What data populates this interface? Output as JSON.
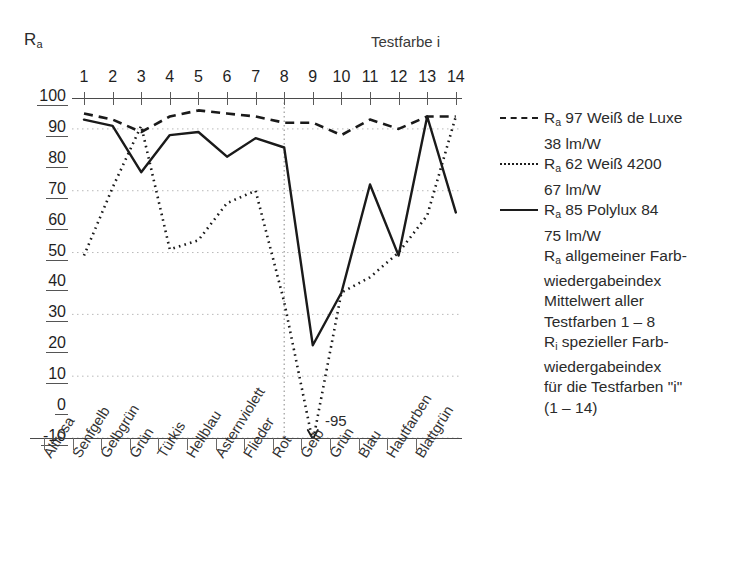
{
  "axes": {
    "y_title": "R",
    "y_title_sub": "a",
    "x_title": "Testfarbe i",
    "y_ticks": [
      "100",
      "90",
      "80",
      "70",
      "60",
      "50",
      "40",
      "30",
      "20",
      "10",
      "0",
      "-10"
    ],
    "x_numbers": [
      "1",
      "2",
      "3",
      "4",
      "5",
      "6",
      "7",
      "8",
      "9",
      "10",
      "11",
      "12",
      "13",
      "14"
    ]
  },
  "annotation": {
    "off_scale_value": "-95"
  },
  "legend": {
    "items": [
      {
        "key": "dashed",
        "r": "R",
        "sub": "a",
        "title": "97 Weiß de Luxe",
        "efficacy": "38 lm/W"
      },
      {
        "key": "dotted",
        "r": "R",
        "sub": "a",
        "title": "62 Weiß 4200",
        "efficacy": "67 lm/W"
      },
      {
        "key": "solid",
        "r": "R",
        "sub": "a",
        "title": "85 Polylux 84",
        "efficacy": "75 lm/W"
      }
    ]
  },
  "notes": {
    "lines": [
      "allgemeiner Farb-",
      "wiedergabeindex",
      "Mittelwert aller",
      "Testfarben 1 – 8"
    ],
    "ra_symbol": "R",
    "ra_sub": "a",
    "ri_symbol": "R",
    "ri_sub": "i",
    "lines2": [
      "spezieller Farb-",
      "wiedergabeindex",
      "für die Testfarben \"i\"",
      "(1 – 14)"
    ]
  },
  "chart_data": {
    "type": "line",
    "title": "",
    "xlabel": "Testfarbe i",
    "ylabel": "Ra",
    "ylim": [
      -10,
      100
    ],
    "grid": true,
    "legend_position": "right",
    "categories": [
      "Altrosa",
      "Senfgelb",
      "Gelbgrün",
      "Grün",
      "Türkis",
      "Hellblau",
      "Asternviolett",
      "Flieder",
      "Rot",
      "Gelb",
      "Grün",
      "Blau",
      "Hautfarben",
      "Blattgrün"
    ],
    "x": [
      1,
      2,
      3,
      4,
      5,
      6,
      7,
      8,
      9,
      10,
      11,
      12,
      13,
      14
    ],
    "series": [
      {
        "name": "Ra 97 Weiß de Luxe 38 lm/W",
        "style": "dashed",
        "values": [
          95,
          93,
          89,
          94,
          96,
          95,
          94,
          92,
          92,
          88,
          93,
          90,
          94,
          94
        ]
      },
      {
        "name": "Ra 62 Weiß 4200 67 lm/W",
        "style": "dotted",
        "values": [
          49,
          71,
          91,
          51,
          54,
          66,
          70,
          34,
          -95,
          37,
          42,
          50,
          62,
          94
        ]
      },
      {
        "name": "Ra 85 Polylux 84 75 lm/W",
        "style": "solid",
        "values": [
          93,
          91,
          76,
          88,
          89,
          81,
          87,
          84,
          20,
          37,
          72,
          49,
          94,
          63
        ]
      }
    ],
    "gridlines_y": [
      90,
      70,
      50,
      30,
      10,
      -10
    ],
    "vertical_rule_at_x": 8,
    "off_scale_note": {
      "series": "Ra 62 Weiß 4200",
      "x": 9,
      "value": -95,
      "label": "-95"
    }
  }
}
